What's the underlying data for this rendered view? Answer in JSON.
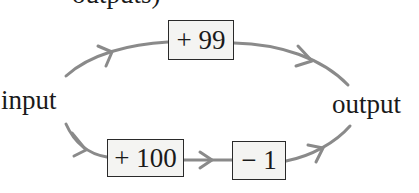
{
  "diagram": {
    "type": "flow",
    "top_cut_text": "outputs)",
    "nodes": {
      "input": {
        "label": "input"
      },
      "output": {
        "label": "output"
      }
    },
    "operations": {
      "top_path": [
        {
          "label": "+ 99"
        }
      ],
      "bottom_path": [
        {
          "label": "+ 100"
        },
        {
          "label": "− 1"
        }
      ]
    },
    "edges": [
      {
        "from": "input",
        "to": "+ 99",
        "path": "top"
      },
      {
        "from": "+ 99",
        "to": "output",
        "path": "top"
      },
      {
        "from": "input",
        "to": "+ 100",
        "path": "bottom"
      },
      {
        "from": "+ 100",
        "to": "− 1",
        "path": "bottom"
      },
      {
        "from": "− 1",
        "to": "output",
        "path": "bottom"
      }
    ],
    "colors": {
      "arrow": "#8a8a8a",
      "box_border": "#2a2a2a",
      "box_fill": "#f4f4f2",
      "text": "#1a1a1a",
      "background": "#ffffff"
    }
  }
}
